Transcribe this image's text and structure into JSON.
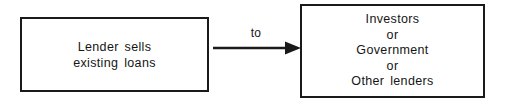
{
  "diagram": {
    "type": "flow-diagram",
    "background_color": "#ffffff",
    "stroke_color": "#1a1a1a",
    "text_color": "#151515",
    "nodes": [
      {
        "id": "lender",
        "name": "lender-box",
        "lines": [
          "Lender sells",
          "existing loans"
        ]
      },
      {
        "id": "buyers",
        "name": "buyers-box",
        "lines": [
          "Investors",
          "or",
          "Government",
          "or",
          "Other lenders"
        ]
      }
    ],
    "edge": {
      "name": "to-arrow",
      "label": "to",
      "from": "lender",
      "to": "buyers",
      "arrowhead": "filled-triangle",
      "direction": "left-to-right"
    }
  },
  "boxes": {
    "lender": {
      "line1": "Lender sells",
      "line2": "existing loans"
    },
    "buyers": {
      "line1": "Investors",
      "line2": "or",
      "line3": "Government",
      "line4": "or",
      "line5": "Other lenders"
    }
  },
  "connector": {
    "label": "to"
  }
}
